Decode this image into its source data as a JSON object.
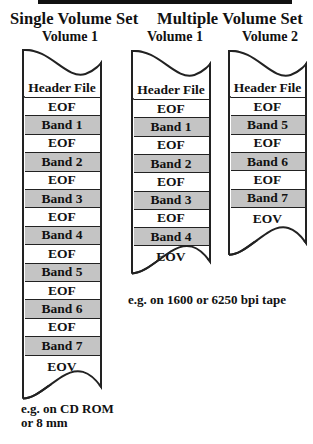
{
  "titles": {
    "single": "Single Volume Set",
    "multiple": "Multiple Volume Set"
  },
  "colors": {
    "band_fill": "#c4c4c4",
    "eof_fill": "#ffffff",
    "line": "#222222"
  },
  "single_volume": {
    "label": "Volume 1",
    "cells": [
      {
        "text": "Header File",
        "kind": "header"
      },
      {
        "text": "EOF",
        "kind": "eof"
      },
      {
        "text": "Band 1",
        "kind": "band"
      },
      {
        "text": "EOF",
        "kind": "eof"
      },
      {
        "text": "Band 2",
        "kind": "band"
      },
      {
        "text": "EOF",
        "kind": "eof"
      },
      {
        "text": "Band 3",
        "kind": "band"
      },
      {
        "text": "EOF",
        "kind": "eof"
      },
      {
        "text": "Band 4",
        "kind": "band"
      },
      {
        "text": "EOF",
        "kind": "eof"
      },
      {
        "text": "Band 5",
        "kind": "band"
      },
      {
        "text": "EOF",
        "kind": "eof"
      },
      {
        "text": "Band 6",
        "kind": "band"
      },
      {
        "text": "EOF",
        "kind": "eof"
      },
      {
        "text": "Band 7",
        "kind": "band"
      },
      {
        "text": "EOV",
        "kind": "eov"
      }
    ],
    "caption_lines": [
      "e.g. on CD ROM",
      "or 8 mm"
    ]
  },
  "multiple_volume": {
    "volumes": [
      {
        "label": "Volume 1",
        "cells": [
          {
            "text": "Header File",
            "kind": "header"
          },
          {
            "text": "EOF",
            "kind": "eof"
          },
          {
            "text": "Band 1",
            "kind": "band"
          },
          {
            "text": "EOF",
            "kind": "eof"
          },
          {
            "text": "Band 2",
            "kind": "band"
          },
          {
            "text": "EOF",
            "kind": "eof"
          },
          {
            "text": "Band 3",
            "kind": "band"
          },
          {
            "text": "EOF",
            "kind": "eof"
          },
          {
            "text": "Band 4",
            "kind": "band"
          },
          {
            "text": "EOV",
            "kind": "eov"
          }
        ]
      },
      {
        "label": "Volume 2",
        "cells": [
          {
            "text": "Header File",
            "kind": "header"
          },
          {
            "text": "EOF",
            "kind": "eof"
          },
          {
            "text": "Band 5",
            "kind": "band"
          },
          {
            "text": "EOF",
            "kind": "eof"
          },
          {
            "text": "Band 6",
            "kind": "band"
          },
          {
            "text": "EOF",
            "kind": "eof"
          },
          {
            "text": "Band 7",
            "kind": "band"
          },
          {
            "text": "EOV",
            "kind": "eov"
          }
        ]
      }
    ],
    "caption": "e.g. on 1600 or 6250 bpi tape"
  }
}
